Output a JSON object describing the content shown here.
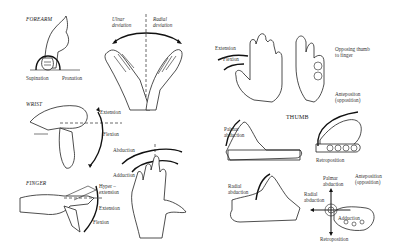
{
  "figure": {
    "sections": {
      "forearm": {
        "heading": "FOREARM",
        "labels": {
          "supination": "Supination",
          "pronation": "Pronation"
        }
      },
      "wrist_deviation": {
        "labels": {
          "ulnar": "Ulnar\ndeviation",
          "radial": "Radial\ndeviation"
        }
      },
      "wrist": {
        "heading": "WRIST",
        "labels": {
          "extension": "Extension",
          "flexion": "Flexion"
        }
      },
      "finger_abduction": {
        "labels": {
          "abduction": "Abduction",
          "adduction": "Adduction"
        }
      },
      "finger": {
        "heading": "FINGER",
        "labels": {
          "hyperextension": "Hyper –\nextension",
          "extension": "Extension",
          "flexion": "Flexion"
        }
      },
      "thumb_flex_ext": {
        "labels": {
          "extension": "Extension",
          "flexion": "Flexion"
        }
      },
      "thumb_opposition": {
        "labels": {
          "opposing": "Opposing thumb\nto finger"
        }
      },
      "thumb": {
        "heading": "THUMB",
        "palmar_abduction": {
          "label": "Palmar\nabduction"
        },
        "antepo_retro": {
          "antepo": "Antepositon\n(opposition)",
          "retro": "Retroposition"
        },
        "radial_abduction": {
          "label": "Radial\nabduction"
        },
        "summary": {
          "palmar": "Palmar\nabduction",
          "antepo": "Anteposition\n(opposition)",
          "radial": "Radial\nabduction",
          "adduction": "Adduction",
          "retro": "Retroposition"
        }
      }
    }
  }
}
